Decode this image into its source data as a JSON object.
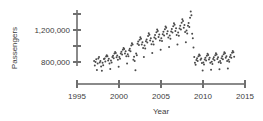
{
  "chart_data": {
    "type": "scatter",
    "title": "",
    "xlabel": "Year",
    "ylabel": "Passengers",
    "xlim": [
      1995,
      2015
    ],
    "ylim": [
      620000,
      1460000
    ],
    "grid": false,
    "legend": null,
    "x_ticks": [
      1995,
      2000,
      2005,
      2010,
      2015
    ],
    "x_tick_labels": [
      "1995",
      "2000",
      "2005",
      "2010",
      "2015"
    ],
    "y_ticks": [
      800000,
      1000000,
      1200000,
      1400000
    ],
    "y_tick_labels": [
      "800,000",
      "",
      "1,200,000",
      ""
    ],
    "y_labeled_ticks": [
      {
        "value": 1400000,
        "label": ""
      },
      {
        "value": 1200000,
        "label": "1,200,000"
      },
      {
        "value": 1000000,
        "label": ""
      },
      {
        "value": 800000,
        "label": "800,000"
      }
    ],
    "marker": {
      "shape": "circle",
      "size_px": 1.5,
      "color": "#4a4a4a"
    },
    "axis_color": "#8a8a8a",
    "series": [
      {
        "name": "Monthly air passengers",
        "points": [
          [
            1997.04,
            812000
          ],
          [
            1997.12,
            755000
          ],
          [
            1997.21,
            800000
          ],
          [
            1997.29,
            835000
          ],
          [
            1997.37,
            700000
          ],
          [
            1997.46,
            780000
          ],
          [
            1997.54,
            845000
          ],
          [
            1997.62,
            862000
          ],
          [
            1997.71,
            795000
          ],
          [
            1997.79,
            812000
          ],
          [
            1997.87,
            745000
          ],
          [
            1997.96,
            690000
          ],
          [
            1998.04,
            790000
          ],
          [
            1998.12,
            760000
          ],
          [
            1998.21,
            838000
          ],
          [
            1998.29,
            845000
          ],
          [
            1998.37,
            805000
          ],
          [
            1998.46,
            868000
          ],
          [
            1998.54,
            885000
          ],
          [
            1998.62,
            872000
          ],
          [
            1998.71,
            818000
          ],
          [
            1998.79,
            840000
          ],
          [
            1998.87,
            782000
          ],
          [
            1998.96,
            712000
          ],
          [
            1999.04,
            818000
          ],
          [
            1999.12,
            795000
          ],
          [
            1999.21,
            862000
          ],
          [
            1999.29,
            878000
          ],
          [
            1999.37,
            848000
          ],
          [
            1999.46,
            905000
          ],
          [
            1999.54,
            925000
          ],
          [
            1999.62,
            912000
          ],
          [
            1999.71,
            858000
          ],
          [
            1999.79,
            880000
          ],
          [
            1999.87,
            828000
          ],
          [
            1999.96,
            742000
          ],
          [
            2000.04,
            862000
          ],
          [
            2000.12,
            840000
          ],
          [
            2000.21,
            905000
          ],
          [
            2000.29,
            928000
          ],
          [
            2000.37,
            895000
          ],
          [
            2000.46,
            952000
          ],
          [
            2000.54,
            975000
          ],
          [
            2000.62,
            962000
          ],
          [
            2000.71,
            905000
          ],
          [
            2000.79,
            935000
          ],
          [
            2000.87,
            872000
          ],
          [
            2000.96,
            782000
          ],
          [
            2001.04,
            898000
          ],
          [
            2001.12,
            872000
          ],
          [
            2001.21,
            948000
          ],
          [
            2001.29,
            965000
          ],
          [
            2001.37,
            935000
          ],
          [
            2001.46,
            1005000
          ],
          [
            2001.54,
            1035000
          ],
          [
            2001.62,
            1018000
          ],
          [
            2001.71,
            828000
          ],
          [
            2001.79,
            865000
          ],
          [
            2001.87,
            812000
          ],
          [
            2001.96,
            698000
          ],
          [
            2002.04,
            905000
          ],
          [
            2002.12,
            885000
          ],
          [
            2002.21,
            1028000
          ],
          [
            2002.29,
            1055000
          ],
          [
            2002.37,
            1012000
          ],
          [
            2002.46,
            1078000
          ],
          [
            2002.54,
            1108000
          ],
          [
            2002.62,
            1092000
          ],
          [
            2002.71,
            1018000
          ],
          [
            2002.79,
            1048000
          ],
          [
            2002.87,
            975000
          ],
          [
            2002.96,
            862000
          ],
          [
            2003.04,
            1005000
          ],
          [
            2003.12,
            968000
          ],
          [
            2003.21,
            1058000
          ],
          [
            2003.29,
            1082000
          ],
          [
            2003.37,
            1045000
          ],
          [
            2003.46,
            1125000
          ],
          [
            2003.54,
            1158000
          ],
          [
            2003.62,
            1142000
          ],
          [
            2003.71,
            1068000
          ],
          [
            2003.79,
            1098000
          ],
          [
            2003.87,
            1022000
          ],
          [
            2003.96,
            912000
          ],
          [
            2004.04,
            1055000
          ],
          [
            2004.12,
            1018000
          ],
          [
            2004.21,
            1105000
          ],
          [
            2004.29,
            1138000
          ],
          [
            2004.37,
            1092000
          ],
          [
            2004.46,
            1172000
          ],
          [
            2004.54,
            1205000
          ],
          [
            2004.62,
            1188000
          ],
          [
            2004.71,
            1112000
          ],
          [
            2004.79,
            1145000
          ],
          [
            2004.87,
            1068000
          ],
          [
            2004.96,
            952000
          ],
          [
            2005.04,
            1098000
          ],
          [
            2005.12,
            1062000
          ],
          [
            2005.21,
            1148000
          ],
          [
            2005.29,
            1178000
          ],
          [
            2005.37,
            1132000
          ],
          [
            2005.46,
            1208000
          ],
          [
            2005.54,
            1245000
          ],
          [
            2005.62,
            1228000
          ],
          [
            2005.71,
            1152000
          ],
          [
            2005.79,
            1185000
          ],
          [
            2005.87,
            1105000
          ],
          [
            2005.96,
            988000
          ],
          [
            2006.04,
            1132000
          ],
          [
            2006.12,
            1092000
          ],
          [
            2006.21,
            1182000
          ],
          [
            2006.29,
            1212000
          ],
          [
            2006.37,
            1168000
          ],
          [
            2006.46,
            1248000
          ],
          [
            2006.54,
            1285000
          ],
          [
            2006.62,
            1265000
          ],
          [
            2006.71,
            1188000
          ],
          [
            2006.79,
            1222000
          ],
          [
            2006.87,
            1138000
          ],
          [
            2006.96,
            1018000
          ],
          [
            2007.04,
            1168000
          ],
          [
            2007.12,
            1128000
          ],
          [
            2007.21,
            1218000
          ],
          [
            2007.29,
            1252000
          ],
          [
            2007.37,
            1205000
          ],
          [
            2007.46,
            1292000
          ],
          [
            2007.54,
            1335000
          ],
          [
            2007.62,
            1312000
          ],
          [
            2007.71,
            1228000
          ],
          [
            2007.79,
            1262000
          ],
          [
            2007.87,
            1175000
          ],
          [
            2007.96,
            1048000
          ],
          [
            2008.04,
            1195000
          ],
          [
            2008.12,
            1155000
          ],
          [
            2008.21,
            1252000
          ],
          [
            2008.29,
            1288000
          ],
          [
            2008.37,
            1238000
          ],
          [
            2008.46,
            1352000
          ],
          [
            2008.54,
            1432000
          ],
          [
            2008.62,
            1385000
          ],
          [
            2008.71,
            1152000
          ],
          [
            2008.79,
            1098000
          ],
          [
            2008.87,
            982000
          ],
          [
            2008.96,
            862000
          ],
          [
            2009.04,
            792000
          ],
          [
            2009.12,
            765000
          ],
          [
            2009.21,
            825000
          ],
          [
            2009.29,
            848000
          ],
          [
            2009.37,
            812000
          ],
          [
            2009.46,
            872000
          ],
          [
            2009.54,
            895000
          ],
          [
            2009.62,
            882000
          ],
          [
            2009.71,
            828000
          ],
          [
            2009.79,
            845000
          ],
          [
            2009.87,
            788000
          ],
          [
            2009.96,
            695000
          ],
          [
            2010.04,
            795000
          ],
          [
            2010.12,
            768000
          ],
          [
            2010.21,
            832000
          ],
          [
            2010.29,
            852000
          ],
          [
            2010.37,
            818000
          ],
          [
            2010.46,
            878000
          ],
          [
            2010.54,
            902000
          ],
          [
            2010.62,
            888000
          ],
          [
            2010.71,
            832000
          ],
          [
            2010.79,
            852000
          ],
          [
            2010.87,
            792000
          ],
          [
            2010.96,
            702000
          ],
          [
            2011.04,
            802000
          ],
          [
            2011.12,
            775000
          ],
          [
            2011.21,
            838000
          ],
          [
            2011.29,
            858000
          ],
          [
            2011.37,
            822000
          ],
          [
            2011.46,
            885000
          ],
          [
            2011.54,
            908000
          ],
          [
            2011.62,
            895000
          ],
          [
            2011.71,
            838000
          ],
          [
            2011.79,
            858000
          ],
          [
            2011.87,
            798000
          ],
          [
            2011.96,
            708000
          ],
          [
            2012.04,
            812000
          ],
          [
            2012.12,
            788000
          ],
          [
            2012.21,
            848000
          ],
          [
            2012.29,
            872000
          ],
          [
            2012.37,
            835000
          ],
          [
            2012.46,
            898000
          ],
          [
            2012.54,
            922000
          ],
          [
            2012.62,
            908000
          ],
          [
            2012.71,
            852000
          ],
          [
            2012.79,
            872000
          ],
          [
            2012.87,
            812000
          ],
          [
            2012.96,
            718000
          ],
          [
            2013.04,
            828000
          ],
          [
            2013.12,
            802000
          ],
          [
            2013.21,
            862000
          ],
          [
            2013.29,
            888000
          ],
          [
            2013.37,
            852000
          ],
          [
            2013.46,
            915000
          ],
          [
            2013.54,
            938000
          ],
          [
            2013.62,
            922000
          ],
          [
            2013.71,
            865000
          ]
        ]
      }
    ]
  }
}
